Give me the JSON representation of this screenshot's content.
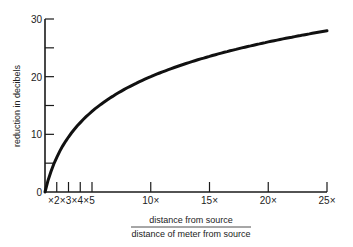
{
  "chart_data": {
    "type": "line",
    "title": "",
    "ylabel": "reduction in decibels",
    "xlabel_numerator": "distance from source",
    "xlabel_denominator": "distance of meter from source",
    "xlim": [
      1,
      25
    ],
    "ylim": [
      0,
      30
    ],
    "grid": false,
    "legend": null,
    "y_ticks": [
      {
        "value": 0,
        "label": "0"
      },
      {
        "value": 5,
        "label": ""
      },
      {
        "value": 10,
        "label": "10"
      },
      {
        "value": 15,
        "label": ""
      },
      {
        "value": 20,
        "label": "20"
      },
      {
        "value": 25,
        "label": ""
      },
      {
        "value": 30,
        "label": "30"
      }
    ],
    "x_ticks": [
      {
        "value": 2,
        "label": "×2"
      },
      {
        "value": 3,
        "label": "×3"
      },
      {
        "value": 4,
        "label": "×4"
      },
      {
        "value": 5,
        "label": "×5"
      },
      {
        "value": 10,
        "label": "10×"
      },
      {
        "value": 15,
        "label": "15×"
      },
      {
        "value": 20,
        "label": "20×"
      },
      {
        "value": 25,
        "label": "25×"
      }
    ],
    "series": [
      {
        "name": "reduction",
        "x": [
          1,
          1.5,
          2,
          3,
          4,
          5,
          6,
          8,
          10,
          12,
          15,
          18,
          20,
          22,
          25
        ],
        "y": [
          0,
          3.5,
          6,
          9.5,
          12,
          14,
          15.6,
          18.1,
          20,
          21.6,
          23.5,
          25.1,
          26,
          26.8,
          28
        ]
      }
    ]
  },
  "labels": {
    "ylabel": "reduction in decibels",
    "xlabel_numerator": "distance from source",
    "xlabel_denominator": "distance of meter from source"
  },
  "colors": {
    "line": "#111111",
    "axis": "#1a1a1a",
    "background": "#ffffff"
  }
}
